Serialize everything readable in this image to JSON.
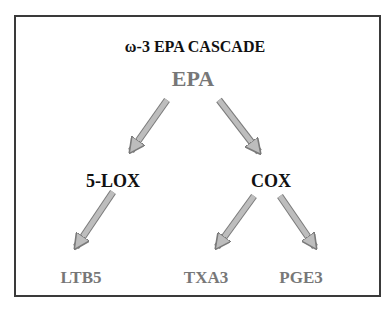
{
  "title": "ω-3 EPA CASCADE",
  "nodes": {
    "root": "EPA",
    "enzyme_left": "5-LOX",
    "enzyme_right": "COX",
    "product_1": "LTB5",
    "product_2": "TXA3",
    "product_3": "PGE3"
  },
  "edges": [
    {
      "from": "EPA",
      "to": "5-LOX"
    },
    {
      "from": "EPA",
      "to": "COX"
    },
    {
      "from": "5-LOX",
      "to": "LTB5"
    },
    {
      "from": "COX",
      "to": "TXA3"
    },
    {
      "from": "COX",
      "to": "PGE3"
    }
  ],
  "colors": {
    "border": "#3a3a3a",
    "arrow_fill": "#bdbdbd",
    "arrow_stroke": "#7a7a7a",
    "metabolite_text": "#777777",
    "enzyme_text": "#111111"
  }
}
